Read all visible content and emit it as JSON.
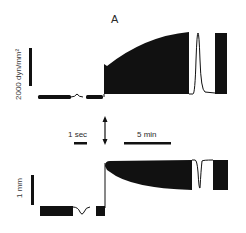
{
  "figure": {
    "panel_label": "A",
    "top_trace": {
      "name": "tension",
      "scale_bar_label": "2000 dyn/mm²"
    },
    "bottom_trace": {
      "name": "length",
      "scale_bar_label": "1 mm"
    },
    "time_scales": {
      "fast": "1 sec",
      "slow": "5 min"
    },
    "stimulus_marker": "double-arrow"
  },
  "colors": {
    "trace": "#111111",
    "text": "#2a2a2a",
    "background": "#ffffff"
  }
}
